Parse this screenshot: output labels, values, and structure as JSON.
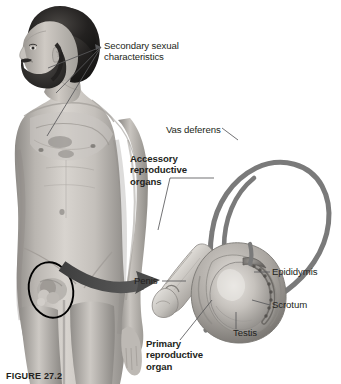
{
  "figure": {
    "caption": "FIGURE 27.2",
    "background_color": "#ffffff",
    "text_color": "#231f20",
    "leader_color": "#58595b",
    "arrow_color": "#4a4a4a",
    "tube_color": "#7a7a7a",
    "circle_color": "#000000"
  },
  "labels": {
    "secondary_sexual_characteristics": "Secondary sexual\ncharacteristics",
    "vas_deferens": "Vas deferens",
    "accessory_reproductive_organs": "Accessory\nreproductive\norgans",
    "penis": "Penis",
    "epididymis": "Epididymis",
    "scrotum": "Scrotum",
    "testis": "Testis",
    "primary_reproductive_organ": "Primary\nreproductive\norgan"
  },
  "illustrations": {
    "photograph": "grayscale-male-torso-photo",
    "highlight_circle": "genital-region-circle",
    "zoom_arrow": "curved-zoom-arrow",
    "detail_drawing": "male-reproductive-organs-detail"
  }
}
